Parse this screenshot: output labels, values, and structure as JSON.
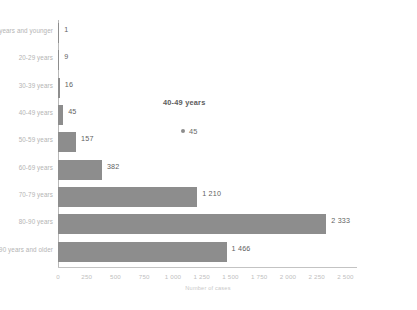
{
  "chart_data": {
    "type": "bar",
    "orientation": "horizontal",
    "title": "",
    "xlabel": "Number of cases",
    "ylabel": "",
    "categories": [
      "years and younger",
      "20-29 years",
      "30-39 years",
      "40-49 years",
      "50-59 years",
      "60-69 years",
      "70-79 years",
      "80-90 years",
      "90 years and older"
    ],
    "values": [
      1,
      9,
      16,
      45,
      157,
      382,
      1210,
      2333,
      1466
    ],
    "value_labels": [
      "1",
      "9",
      "16",
      "45",
      "157",
      "382",
      "1 210",
      "2 333",
      "1 466"
    ],
    "xticks": [
      0,
      250,
      500,
      750,
      1000,
      1250,
      1500,
      1750,
      2000,
      2250,
      2500
    ],
    "xtick_labels": [
      "0",
      "250",
      "500",
      "750",
      "1 000",
      "1 250",
      "1 500",
      "1 750",
      "2 000",
      "2 250",
      "2 500"
    ],
    "xlim": [
      0,
      2600
    ],
    "grid": false,
    "legend": false,
    "bar_color": "#8d8d8d"
  },
  "tooltip": {
    "title": "40-49 years",
    "value_label": "45"
  },
  "footer": {
    "credit": ""
  }
}
